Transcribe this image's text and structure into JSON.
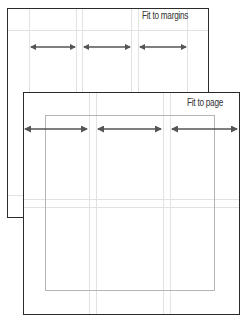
{
  "diagram": {
    "pages": [
      {
        "id": "fit-to-margins",
        "label": "Fit to margins",
        "box": {
          "x": 7,
          "y": 8,
          "w": 202,
          "h": 210
        },
        "guides_v": [
          29,
          76,
          82,
          131,
          138,
          187
        ],
        "guides_h": [
          30,
          195
        ],
        "arrows": [
          {
            "x1": 30,
            "x2": 76,
            "y": 47
          },
          {
            "x1": 83,
            "x2": 131,
            "y": 47
          },
          {
            "x1": 139,
            "x2": 187,
            "y": 47
          }
        ]
      },
      {
        "id": "fit-to-page",
        "label": "Fit to page",
        "box": {
          "x": 23,
          "y": 92,
          "w": 217,
          "h": 223
        },
        "margin_rect": {
          "x": 45,
          "y": 115,
          "w": 170,
          "h": 176
        },
        "guides_v": [
          89,
          96,
          163,
          170
        ],
        "guides_h": [
          199,
          207
        ],
        "arrows": [
          {
            "x1": 24,
            "x2": 88,
            "y": 129
          },
          {
            "x1": 97,
            "x2": 162,
            "y": 129
          },
          {
            "x1": 171,
            "x2": 238,
            "y": 129
          }
        ]
      }
    ],
    "colors": {
      "page_border": "#2b2b2b",
      "guide": "#e2e2e2",
      "margin_rect": "#b5b5b5",
      "arrow": "#555555",
      "label": "#333333"
    }
  }
}
